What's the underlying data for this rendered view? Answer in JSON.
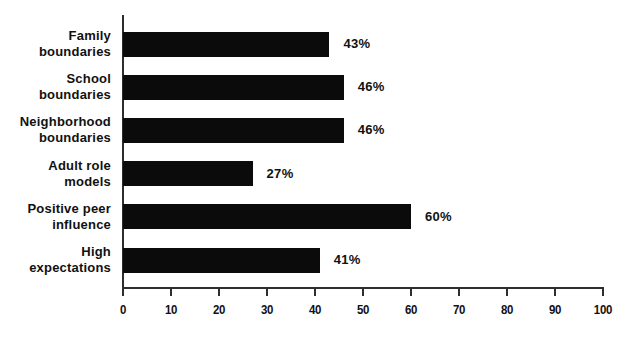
{
  "chart_data": {
    "type": "bar",
    "orientation": "horizontal",
    "title": "",
    "xlabel": "",
    "ylabel": "",
    "categories": [
      "Family\nboundaries",
      "School\nboundaries",
      "Neighborhood\nboundaries",
      "Adult role\nmodels",
      "Positive peer\ninfluence",
      "High\nexpectations"
    ],
    "values": [
      43,
      46,
      46,
      27,
      60,
      41
    ],
    "value_labels": [
      "43%",
      "46%",
      "46%",
      "27%",
      "60%",
      "41%"
    ],
    "xlim": [
      0,
      100
    ],
    "x_ticks": [
      0,
      10,
      20,
      30,
      40,
      50,
      60,
      70,
      80,
      90,
      100
    ],
    "grid": false,
    "legend": "none",
    "bar_color": "#0b0b0b",
    "axis_color": "#2e2e2e",
    "text_color": "#111111",
    "background_color": "#ffffff"
  }
}
